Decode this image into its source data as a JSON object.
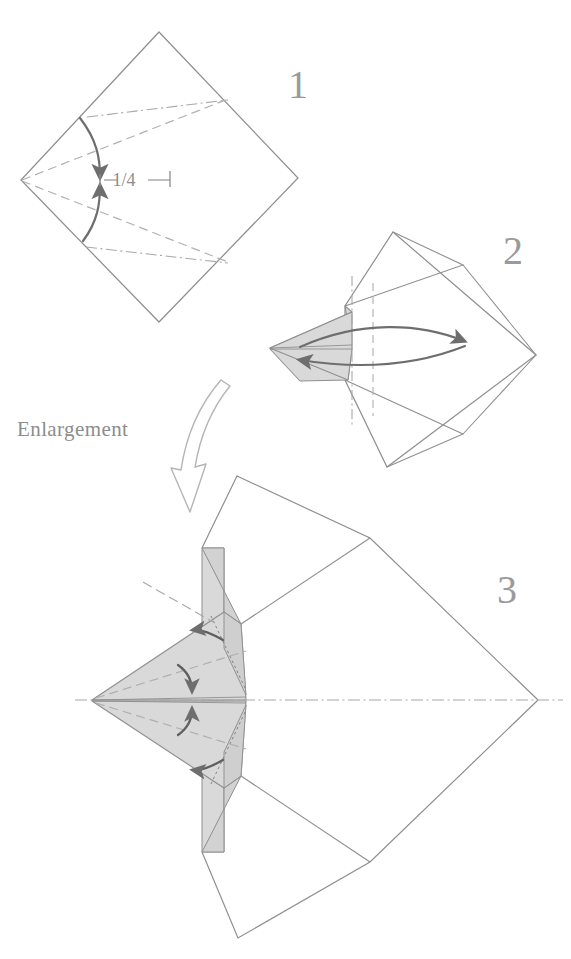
{
  "document": {
    "kind": "origami-folding-diagram",
    "title": "Origami folding sequence",
    "background_color": "#ffffff"
  },
  "palette": {
    "edge_line": "#8f8f8f",
    "edge_line_dark": "#7d7d7d",
    "crease_dashed": "#b0b0b0",
    "crease_dashdot": "#a8a8a8",
    "shaded_face": "#d9d9d9",
    "shaded_face_dark": "#cccccc",
    "arrow_solid": "#6e6e6e",
    "arrow_hollow_stroke": "#b5b5b5",
    "text_gray": "#9a9a9a"
  },
  "steps": [
    {
      "id": "step-1",
      "number": "1",
      "number_position": {
        "x": 288,
        "y": 98
      },
      "description": "Square sheet oriented as a diamond with pre-creased reference lines; fold edges to meet at the quarter mark.",
      "annotations": [
        {
          "id": "measure-quarter",
          "type": "measurement-label",
          "text": "1/4",
          "position": {
            "x": 124,
            "y": 178
          }
        }
      ]
    },
    {
      "id": "step-2",
      "number": "2",
      "number_position": {
        "x": 503,
        "y": 264
      },
      "description": "Flaps folded to the left forming a shaded point; double-headed arrow indicates swinging the point back and forth."
    },
    {
      "id": "step-3",
      "number": "3",
      "number_position": {
        "x": 497,
        "y": 603
      },
      "description": "Enlarged view of the point with four small fold arrows on the narrow shaded flaps."
    }
  ],
  "labels": {
    "enlargement": {
      "text": "Enlargement",
      "position": {
        "x": 17,
        "y": 436
      }
    }
  },
  "legend": {
    "line_styles": [
      {
        "name": "edge",
        "style": "solid",
        "meaning": "paper edge"
      },
      {
        "name": "valley-crease",
        "style": "dashed",
        "meaning": "valley fold crease"
      },
      {
        "name": "reference-axis",
        "style": "dash-dot",
        "meaning": "reference / symmetry axis"
      }
    ],
    "arrow_types": [
      {
        "name": "fold-arrow",
        "style": "solid-curved",
        "meaning": "fold in direction of arrow"
      },
      {
        "name": "swing-arrow",
        "style": "double-headed-curved",
        "meaning": "swing flap back and forth"
      },
      {
        "name": "enlargement-arrow",
        "style": "hollow-curved",
        "meaning": "view is enlarged below"
      }
    ]
  },
  "icons": {
    "enlargement_arrow": "hollow-curved-down-arrow-icon",
    "swing_arrow": "double-headed-curved-arrow-icon",
    "fold_arrow": "solid-curved-fold-arrow-icon",
    "tick_mark": "measurement-tick-icon"
  }
}
